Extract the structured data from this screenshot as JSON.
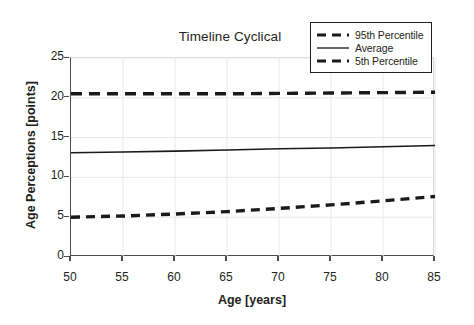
{
  "chart_data": {
    "type": "line",
    "title": "Timeline Cyclical",
    "xlabel": "Age [years]",
    "ylabel": "Age Perceptions [points]",
    "xlim": [
      50,
      85
    ],
    "ylim": [
      0,
      25
    ],
    "xticks": [
      50,
      55,
      60,
      65,
      70,
      75,
      80,
      85
    ],
    "yticks": [
      0,
      5,
      10,
      15,
      20,
      25
    ],
    "grid": true,
    "legend_position": "top-right",
    "x": [
      50,
      55,
      60,
      65,
      70,
      75,
      80,
      85
    ],
    "series": [
      {
        "name": "95th Percentile",
        "style": "dashed",
        "color": "#1a1a1a",
        "values": [
          20.5,
          20.5,
          20.5,
          20.5,
          20.55,
          20.6,
          20.65,
          20.7
        ]
      },
      {
        "name": "Average",
        "style": "solid",
        "color": "#1a1a1a",
        "values": [
          13.1,
          13.2,
          13.3,
          13.45,
          13.6,
          13.7,
          13.85,
          14.0
        ]
      },
      {
        "name": "5th Percentile",
        "style": "dashed",
        "color": "#1a1a1a",
        "values": [
          5.0,
          5.15,
          5.4,
          5.7,
          6.1,
          6.55,
          7.05,
          7.6
        ]
      }
    ]
  },
  "chart": {
    "title": "Timeline Cyclical",
    "x_axis_title": "Age [years]",
    "y_axis_title": "Age Perceptions [points]",
    "x_tick_labels": [
      "50",
      "55",
      "60",
      "65",
      "70",
      "75",
      "80",
      "85"
    ],
    "y_tick_labels": [
      "0",
      "5",
      "10",
      "15",
      "20",
      "25"
    ]
  },
  "legend": {
    "items": [
      {
        "label": "95th Percentile",
        "style": "dashed"
      },
      {
        "label": "Average",
        "style": "solid"
      },
      {
        "label": "5th Percentile",
        "style": "dashed"
      }
    ]
  },
  "colors": {
    "line": "#1a1a1a",
    "axis": "#4d4d4d",
    "grid": "#e8e8e8",
    "text": "#231f20",
    "background": "#ffffff"
  }
}
